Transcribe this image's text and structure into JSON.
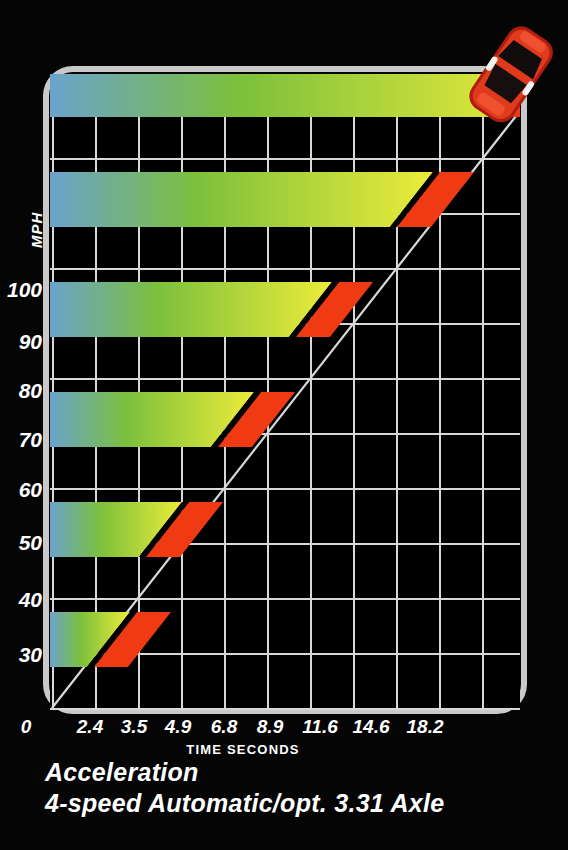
{
  "caption": {
    "line1": "Acceleration",
    "line2": "4-speed Automatic/opt. 3.31 Axle"
  },
  "axes": {
    "y_title": "MPH",
    "x_title": "TIME SECONDS",
    "x_origin_label": "0",
    "y_tick_labels": [
      "100",
      "90",
      "80",
      "70",
      "60",
      "50",
      "40",
      "30"
    ],
    "x_tick_labels": [
      "2.4",
      "3.5",
      "4.9",
      "6.8",
      "8.9",
      "11.6",
      "14.6",
      "18.2"
    ]
  },
  "colors": {
    "frame": "#c9c9c9",
    "grid": "#d8d8d8",
    "background": "#000000",
    "red": "#ef3a13",
    "blue": "#6aa3cc",
    "green": "#7cc03c",
    "yellow": "#ecec3a",
    "text": "#ffffff",
    "car_body": "#d4281c",
    "car_highlight": "#ef4a2a"
  },
  "icons": {
    "car": "sports-car-icon"
  },
  "chart_data": {
    "type": "bar",
    "title": "Acceleration",
    "subtitle": "4-speed Automatic/opt. 3.31 Axle",
    "xlabel": "TIME SECONDS",
    "ylabel": "MPH",
    "orientation": "horizontal",
    "categories": [
      30,
      40,
      50,
      60,
      70,
      80,
      90,
      100
    ],
    "values": [
      2.4,
      3.5,
      4.9,
      6.8,
      8.9,
      11.6,
      14.6,
      18.2
    ],
    "value_unit": "seconds",
    "category_unit": "mph",
    "xlim": [
      0,
      21.5
    ],
    "ylim": [
      0,
      120
    ],
    "grid": true,
    "legend": null,
    "annotations": [
      "red sports car at end of diagonal trend line"
    ],
    "points": [
      {
        "mph": 30,
        "seconds": 2.4
      },
      {
        "mph": 40,
        "seconds": 3.5
      },
      {
        "mph": 50,
        "seconds": 4.9
      },
      {
        "mph": 60,
        "seconds": 6.8
      },
      {
        "mph": 70,
        "seconds": 8.9
      },
      {
        "mph": 80,
        "seconds": 11.6
      },
      {
        "mph": 90,
        "seconds": 14.6
      },
      {
        "mph": 100,
        "seconds": 18.2
      }
    ]
  },
  "layout": {
    "bands": [
      {
        "label": "30",
        "top": 648,
        "height": 55,
        "tipx": 80
      },
      {
        "label": "40",
        "top": 538,
        "height": 55,
        "tipx": 121
      },
      {
        "label": "50",
        "top": 428,
        "height": 55,
        "tipx": 173
      },
      {
        "label": "60",
        "top": 318,
        "height": 55,
        "tipx": 245
      },
      {
        "label": "70",
        "top": 208,
        "height": 55,
        "tipx": 323
      },
      {
        "label": "80",
        "top": 98,
        "height": 55,
        "tipx": 424
      },
      {
        "label": "90",
        "top": -12,
        "height": 55,
        "tipx": 536
      },
      {
        "label": "100",
        "top": -122,
        "height": 55,
        "tipx": 670
      }
    ]
  }
}
